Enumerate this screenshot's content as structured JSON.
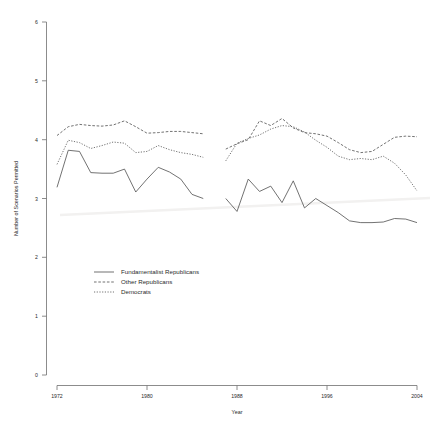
{
  "chart_data": {
    "type": "line",
    "title": "",
    "xlabel": "Year",
    "ylabel": "Number of Scenarios Permitted",
    "xlim": [
      1972,
      2004
    ],
    "ylim": [
      0,
      6
    ],
    "xticks": [
      1972,
      1980,
      1988,
      1996,
      2004
    ],
    "yticks": [
      0,
      1,
      2,
      3,
      4,
      5,
      6
    ],
    "grid": false,
    "legend_position": "lower-left",
    "note": "Series are split into two time blocks with a gap between 1985 and 1987",
    "series": [
      {
        "name": "Fundamentalist Republicans",
        "style": "solid",
        "segments": [
          {
            "x": [
              1972,
              1973,
              1974,
              1975,
              1976,
              1977,
              1978,
              1979,
              1980,
              1981,
              1982,
              1983,
              1984,
              1985
            ],
            "y": [
              3.19,
              3.82,
              3.8,
              3.44,
              3.43,
              3.43,
              3.5,
              3.11,
              3.33,
              3.53,
              3.45,
              3.33,
              3.07,
              3.0
            ]
          },
          {
            "x": [
              1987,
              1988,
              1989,
              1990,
              1991,
              1992,
              1993,
              1994,
              1995,
              1996,
              1997,
              1998,
              1999,
              2000,
              2001,
              2002,
              2003,
              2004
            ],
            "y": [
              3.0,
              2.78,
              3.33,
              3.12,
              3.21,
              2.93,
              3.3,
              2.84,
              3.0,
              2.88,
              2.76,
              2.62,
              2.59,
              2.59,
              2.6,
              2.66,
              2.65,
              2.59
            ]
          }
        ]
      },
      {
        "name": "Other Republicans",
        "style": "dashed",
        "segments": [
          {
            "x": [
              1972,
              1973,
              1974,
              1975,
              1976,
              1977,
              1978,
              1979,
              1980,
              1981,
              1982,
              1983,
              1984,
              1985
            ],
            "y": [
              4.07,
              4.22,
              4.26,
              4.24,
              4.23,
              4.25,
              4.32,
              4.22,
              4.11,
              4.12,
              4.14,
              4.14,
              4.12,
              4.1
            ]
          },
          {
            "x": [
              1987,
              1988,
              1989,
              1990,
              1991,
              1992,
              1993,
              1994,
              1995,
              1996,
              1997,
              1998,
              1999,
              2000,
              2001,
              2002,
              2003,
              2004
            ],
            "y": [
              3.84,
              3.93,
              4.0,
              4.32,
              4.24,
              4.36,
              4.2,
              4.12,
              4.1,
              4.06,
              3.95,
              3.83,
              3.78,
              3.8,
              3.92,
              4.04,
              4.06,
              4.05
            ]
          }
        ]
      },
      {
        "name": "Democrats",
        "style": "dotted",
        "segments": [
          {
            "x": [
              1972,
              1973,
              1974,
              1975,
              1976,
              1977,
              1978,
              1979,
              1980,
              1981,
              1982,
              1983,
              1984,
              1985
            ],
            "y": [
              3.58,
              3.99,
              3.95,
              3.85,
              3.9,
              3.96,
              3.94,
              3.78,
              3.8,
              3.9,
              3.83,
              3.78,
              3.75,
              3.7
            ]
          },
          {
            "x": [
              1987,
              1988,
              1989,
              1990,
              1991,
              1992,
              1993,
              1994,
              1995,
              1996,
              1997,
              1998,
              1999,
              2000,
              2001,
              2002,
              2003,
              2004
            ],
            "y": [
              3.64,
              3.94,
              4.02,
              4.08,
              4.18,
              4.24,
              4.22,
              4.13,
              3.99,
              3.87,
              3.72,
              3.66,
              3.68,
              3.66,
              3.72,
              3.6,
              3.4,
              3.13
            ]
          }
        ]
      }
    ]
  },
  "axes": {
    "y_label": "Number of Scenarios Permitted",
    "x_label": "Year",
    "y_ticks": [
      "0",
      "1",
      "2",
      "3",
      "4",
      "5",
      "6"
    ],
    "x_ticks": [
      "1972",
      "1980",
      "1988",
      "1996",
      "2004"
    ]
  },
  "legend": {
    "items": [
      {
        "label": "Fundamentalist Republicans",
        "style": "solid"
      },
      {
        "label": "Other Republicans",
        "style": "dashed"
      },
      {
        "label": "Democrats",
        "style": "dotted"
      }
    ]
  },
  "colors": {
    "line": "#585858",
    "axis": "#6e6e6e",
    "text": "#2b2b2b",
    "background": "#ffffff"
  }
}
